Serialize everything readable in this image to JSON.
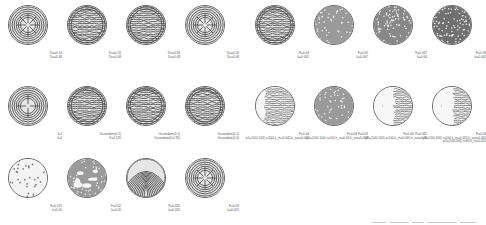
{
  "figure": {
    "left_block": {
      "rows": [
        {
          "items": [
            {
              "pattern": "radial-labyrinth",
              "label_lines": [
                "Du=0.14",
                "Dv=0.36"
              ]
            },
            {
              "pattern": "labyrinth",
              "label_lines": [
                "Du=0.16",
                "Dv=0.08"
              ]
            },
            {
              "pattern": "labyrinth",
              "label_lines": [
                "Du=0.18",
                "Dv=0.08"
              ]
            },
            {
              "pattern": "concentric-labyrinth",
              "label_lines": [
                "Du=0.20",
                "Dv=0.08"
              ]
            }
          ]
        },
        {
          "items": [
            {
              "pattern": "cross-labyrinth",
              "label_lines": [
                "l=1",
                "f=0"
              ]
            },
            {
              "pattern": "labyrinth",
              "label_lines": [
                "U=random(0,1)",
                "V=0.135"
              ]
            },
            {
              "pattern": "labyrinth",
              "label_lines": [
                "U=random(0,1)",
                "V=random(0,0.35)"
              ]
            },
            {
              "pattern": "dense-labyrinth",
              "label_lines": [
                "U=random(0,1)",
                "V=random(0,0)"
              ]
            }
          ]
        },
        {
          "items": [
            {
              "pattern": "spots-sparse",
              "label_lines": [
                "F=0.015",
                "k=0.05"
              ]
            },
            {
              "pattern": "spots-holes",
              "label_lines": [
                "F=0.02",
                "k=0.05"
              ]
            },
            {
              "pattern": "stripes-curved",
              "label_lines": [
                "F=0.025",
                "k=0.055"
              ]
            },
            {
              "pattern": "stripes-radial",
              "label_lines": [
                "F=0.03",
                "k=0.055"
              ]
            }
          ]
        }
      ]
    },
    "right_block": {
      "rows": [
        {
          "items": [
            {
              "pattern": "labyrinth",
              "label_lines": [
                "F=0.04",
                "k=0.061"
              ]
            },
            {
              "pattern": "spots",
              "label_lines": [
                "F=0.05",
                "k=0.067"
              ]
            },
            {
              "pattern": "spots-dense",
              "label_lines": [
                "F=0.067",
                "k=0.06"
              ]
            },
            {
              "pattern": "spots-dark",
              "label_lines": [
                "F=0.08",
                "k=0.062"
              ]
            }
          ]
        },
        {
          "items": [
            {
              "pattern": "front-labyrinth",
              "label_lines": [
                "F=0.04",
                "p1=(100,100)  r=100  k_in=0.045  k_out=0.061"
              ]
            },
            {
              "pattern": "front-spots",
              "label_lines": [
                "F=0.06 F=0.09",
                "p1=(100,100)  r=100  k_in=0.06  k_out=0.068"
              ]
            },
            {
              "pattern": "front-mixed",
              "label_lines": [
                "F=0.04, F=0.061",
                "p1=(100,100)  r=100  k_in=0.065  k_out=0.06"
              ]
            },
            {
              "pattern": "front-multi",
              "label_lines": [
                "F=0.04",
                "p1=(100,100)  r=100  k_in=0.055  k_out=0.061",
                "p2=(200,200)  r=60  k_in=0.055"
              ]
            }
          ]
        }
      ]
    }
  }
}
